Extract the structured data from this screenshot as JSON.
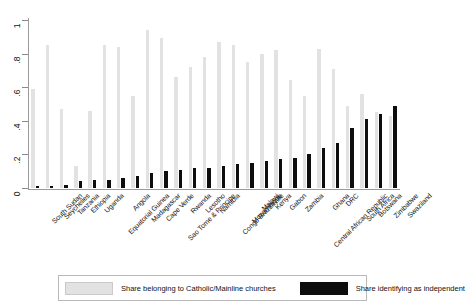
{
  "chart_data": {
    "type": "bar",
    "title": "",
    "subtitle": "",
    "xlabel": "",
    "ylabel": "",
    "ylim": [
      0,
      1
    ],
    "grid": false,
    "legend_position": "bottom",
    "ytick_labels": [
      "0",
      ".2",
      ".4",
      ".6",
      ".8",
      "1"
    ],
    "ytick_values": [
      0,
      0.2,
      0.4,
      0.6,
      0.8,
      1
    ],
    "categories": [
      "South Sudan",
      "Seychelles",
      "Tanzania",
      "Ethiopia",
      "Uganda",
      "Equatorial Guinea",
      "Angola",
      "Madagascar",
      "Cape Verde",
      "Sao Tome & Principe",
      "Rwanda",
      "Lesotho",
      "Namibia",
      "Congo Brazzaville",
      "Mozambique",
      "Malawi",
      "Kenya",
      "Gabon",
      "Zambia",
      "Central African Republic",
      "Ghana",
      "DRC",
      "South Africa",
      "Botswana",
      "Zimbabwe",
      "Swaziland"
    ],
    "series": [
      {
        "name": "Share belonging to Catholic/Mainline churches",
        "color": "#e2e2e2",
        "values": [
          0.59,
          0.85,
          0.47,
          0.13,
          0.46,
          0.85,
          0.84,
          0.55,
          0.94,
          0.89,
          0.66,
          0.72,
          0.78,
          0.87,
          0.85,
          0.75,
          0.8,
          0.82,
          0.64,
          0.55,
          0.83,
          0.71,
          0.49,
          0.56,
          0.45,
          0.43
        ]
      },
      {
        "name": "Share identifying as independent",
        "color": "#0d0d0d",
        "values": [
          0.01,
          0.01,
          0.02,
          0.04,
          0.05,
          0.05,
          0.06,
          0.07,
          0.09,
          0.1,
          0.11,
          0.12,
          0.12,
          0.13,
          0.14,
          0.15,
          0.16,
          0.17,
          0.18,
          0.2,
          0.24,
          0.27,
          0.36,
          0.41,
          0.44,
          0.49
        ]
      }
    ]
  },
  "legend": {
    "entries": [
      {
        "label": "Share belonging to Catholic/Mainline churches",
        "swatch": "light-swatch"
      },
      {
        "label": "Share identifying as independent",
        "swatch": "dark-swatch"
      }
    ]
  }
}
